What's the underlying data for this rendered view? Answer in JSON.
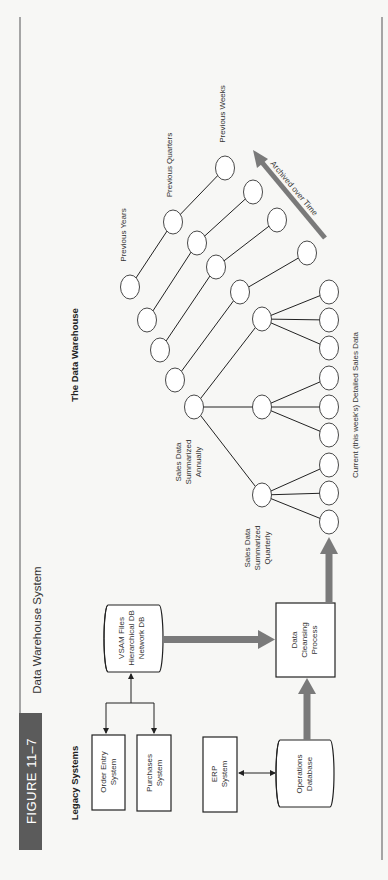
{
  "figure": {
    "badge": "FIGURE 11–7",
    "title": "Data Warehouse System",
    "colors": {
      "badge_bg": "#5b5b5b",
      "arrow": "#7a7a7a",
      "rule": "#8a8a8a"
    }
  },
  "legacy": {
    "heading": "Legacy Systems",
    "order_entry": [
      "Order Entry",
      "System"
    ],
    "purchases": [
      "Purchases",
      "System"
    ],
    "vsam": [
      "VSAM Files",
      "Hierarchical DB",
      "Network DB"
    ],
    "erp": [
      "ERP",
      "System"
    ],
    "operations_db": [
      "Operations",
      "Database"
    ]
  },
  "process": {
    "cleansing": [
      "Data",
      "Cleansing",
      "Process"
    ]
  },
  "warehouse": {
    "heading": "The Data Warehouse",
    "annual_label": [
      "Sales Data",
      "Summarized",
      "Annually"
    ],
    "quarterly_label": [
      "Sales Data",
      "Summarized",
      "Quarterly"
    ],
    "current_label": "Current (this week's) Detailed Sales Data",
    "previous_years": "Previous Years",
    "previous_quarters": "Previous Quarters",
    "previous_weeks": "Previous Weeks",
    "archived": "Archived over Time"
  }
}
